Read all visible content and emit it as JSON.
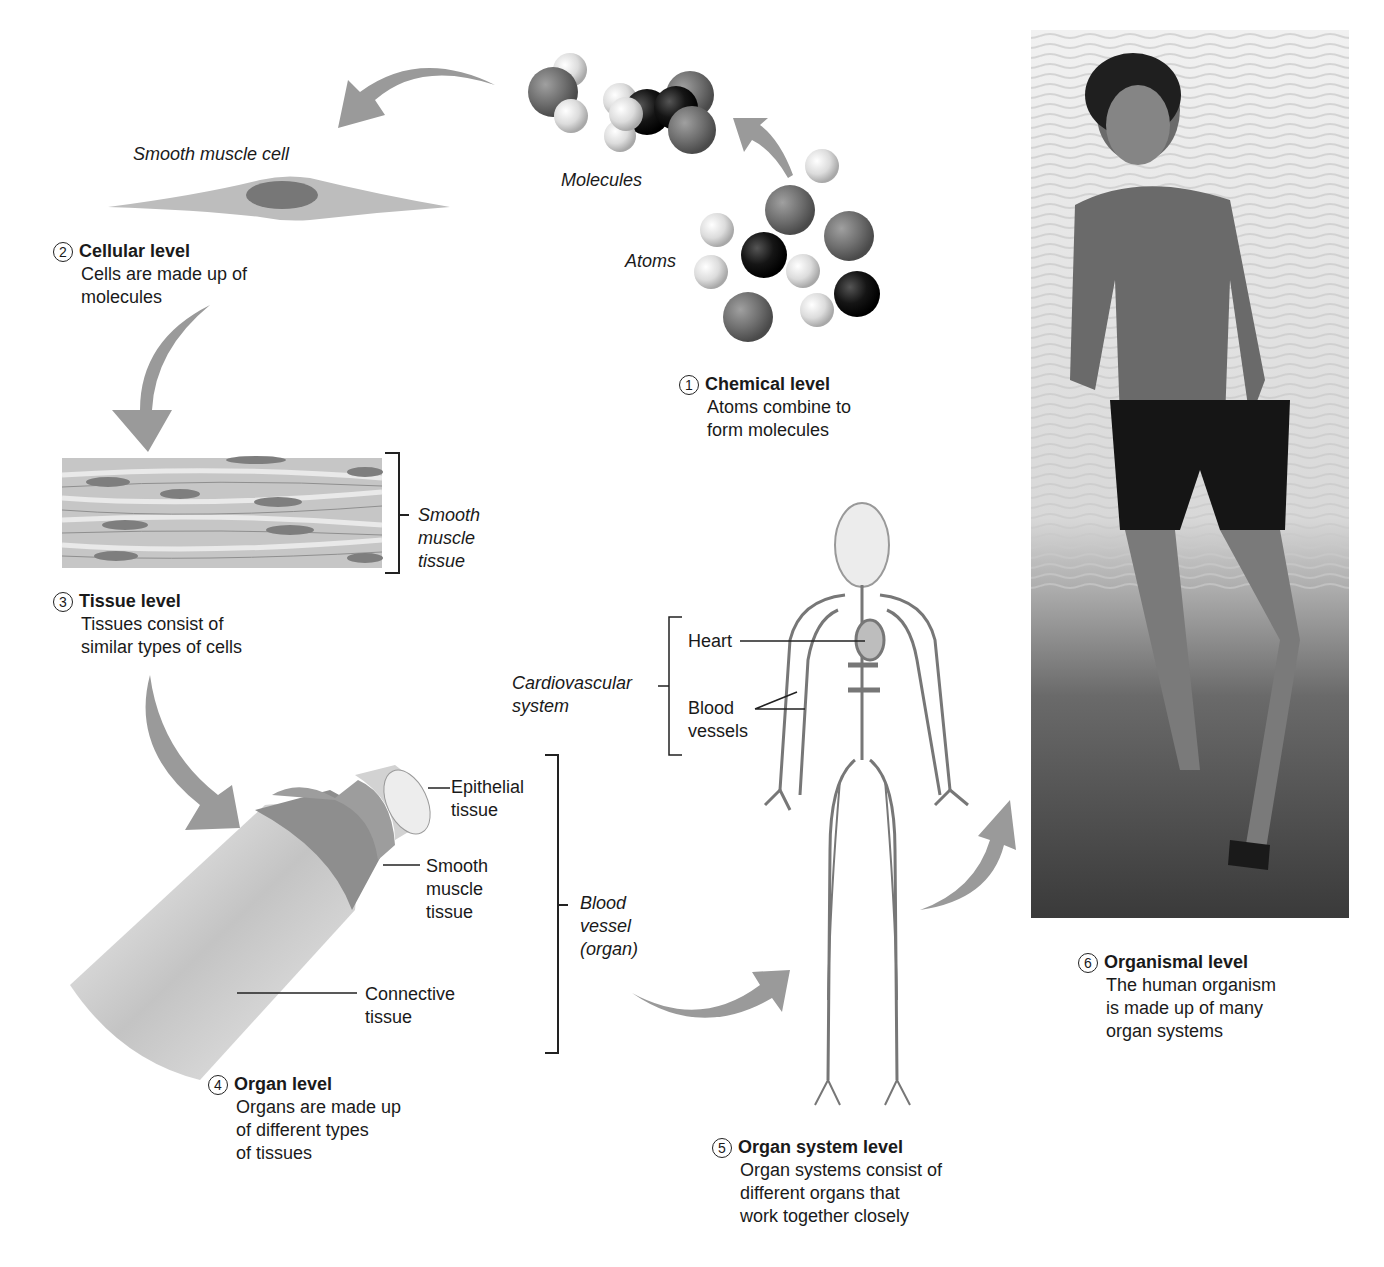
{
  "colors": {
    "arrow": "#9a9a9a",
    "atom_light": "#e6e6e6",
    "atom_mid": "#7a7a7a",
    "atom_dark": "#151515",
    "text": "#1a1a1a",
    "line": "#222222"
  },
  "levels": [
    {
      "number": "1",
      "title": "Chemical level",
      "description": [
        "Atoms combine to",
        "form molecules"
      ]
    },
    {
      "number": "2",
      "title": "Cellular level",
      "description": [
        "Cells are made up of",
        "molecules"
      ]
    },
    {
      "number": "3",
      "title": "Tissue level",
      "description": [
        "Tissues consist of",
        "similar types of cells"
      ]
    },
    {
      "number": "4",
      "title": "Organ level",
      "description": [
        "Organs are made up",
        "of different types",
        "of tissues"
      ]
    },
    {
      "number": "5",
      "title": "Organ system level",
      "description": [
        "Organ systems consist of",
        "different organs that",
        "work together closely"
      ]
    },
    {
      "number": "6",
      "title": "Organismal level",
      "description": [
        "The human organism",
        "is made up of many",
        "organ systems"
      ]
    }
  ],
  "labels": {
    "molecules": "Molecules",
    "atoms": "Atoms",
    "smooth_muscle_cell": "Smooth muscle cell",
    "smooth_muscle_tissue": [
      "Smooth",
      "muscle",
      "tissue"
    ],
    "epithelial_tissue": [
      "Epithelial",
      "tissue"
    ],
    "smooth_muscle_tissue_organ": [
      "Smooth",
      "muscle",
      "tissue"
    ],
    "connective_tissue": [
      "Connective",
      "tissue"
    ],
    "blood_vessel_organ": [
      "Blood",
      "vessel",
      "(organ)"
    ],
    "cardiovascular_system": [
      "Cardiovascular",
      "system"
    ],
    "heart": "Heart",
    "blood_vessels": [
      "Blood",
      "vessels"
    ]
  }
}
